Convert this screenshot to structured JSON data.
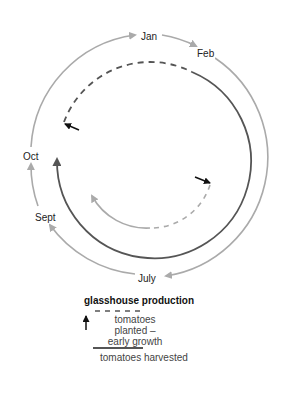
{
  "diagram": {
    "months": {
      "jan": "Jan",
      "feb": "Feb",
      "oct": "Oct",
      "sept": "Sept",
      "july": "July"
    },
    "colors": {
      "outer_cycle": "#aaaaaa",
      "planted_dashed": "#555555",
      "harvested": "#555555",
      "inner_cycle": "#aaaaaa",
      "pointer_arrow": "#111111"
    }
  },
  "legend": {
    "title": "glasshouse production",
    "planted_line1": "tomatoes planted –",
    "planted_line2": "early growth",
    "harvested": "tomatoes harvested"
  }
}
